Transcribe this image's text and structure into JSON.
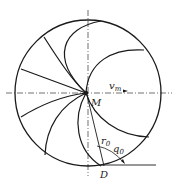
{
  "diagram": {
    "labels": {
      "velocity": "v",
      "velocity_sub": "m",
      "center": "M",
      "radius": "r",
      "radius_sub": "0",
      "angle": "q",
      "angle_sub": "0",
      "point": "D"
    },
    "colors": {
      "stroke": "#1a1a1a",
      "background": "#ffffff"
    }
  }
}
